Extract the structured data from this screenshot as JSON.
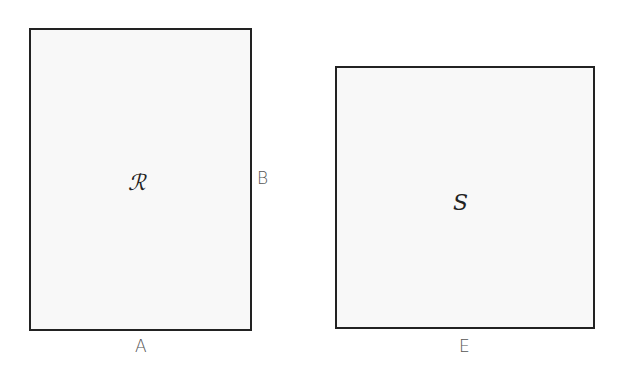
{
  "diagram": {
    "shapes": [
      {
        "id": "R",
        "label": "ℛ",
        "type": "rectangle",
        "width_label": "A",
        "height_label": "B"
      },
      {
        "id": "S",
        "label": "S",
        "type": "square",
        "side_label": "E"
      }
    ],
    "labels": {
      "r": "ℛ",
      "s": "S",
      "a": "A",
      "b": "B",
      "e": "E"
    },
    "colors": {
      "fill": "#f8f8f8",
      "stroke": "#222222"
    }
  }
}
